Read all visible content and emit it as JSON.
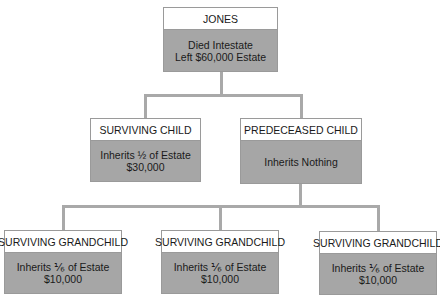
{
  "diagram": {
    "root": {
      "title": "JONES",
      "line1": "Died Intestate",
      "line2": "Left $60,000 Estate"
    },
    "children": [
      {
        "title": "SURVIVING CHILD",
        "line1": "Inherits ½ of Estate",
        "line2": "$30,000"
      },
      {
        "title": "PREDECEASED CHILD",
        "line1": "Inherits Nothing",
        "line2": ""
      }
    ],
    "grandchildren": [
      {
        "title": "SURVIVING GRANDCHILD",
        "line1": "Inherits ⅙ of Estate",
        "line2": "$10,000"
      },
      {
        "title": "SURVIVING GRANDCHILD",
        "line1": "Inherits ⅙ of Estate",
        "line2": "$10,000"
      },
      {
        "title": "SURVIVING GRANDCHILD",
        "line1": "Inherits ⅙ of Estate",
        "line2": "$10,000"
      }
    ],
    "colors": {
      "box_body": "#a6a6a6",
      "box_header": "#ffffff",
      "connector": "#a9a9a9"
    }
  }
}
